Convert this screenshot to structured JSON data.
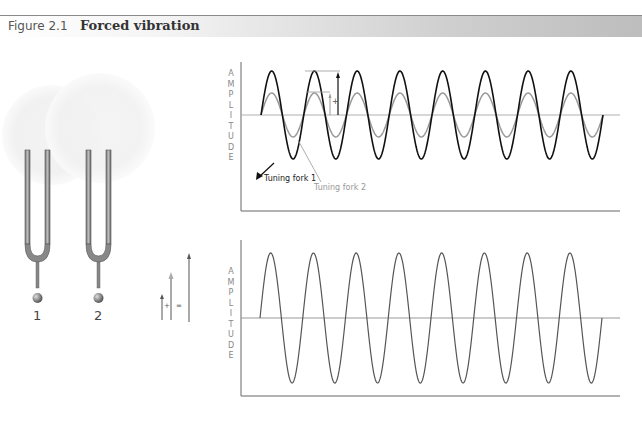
{
  "figure": {
    "number": "Figure 2.1",
    "title": "Forced vibration"
  },
  "forks": [
    {
      "label": "1"
    },
    {
      "label": "2"
    }
  ],
  "vector_sum": {
    "plus": "+",
    "equals": "="
  },
  "top_chart": {
    "ylabel_letters": [
      "A",
      "M",
      "P",
      "L",
      "I",
      "T",
      "U",
      "D",
      "E"
    ],
    "legend": {
      "fork1": "Tuning fork 1",
      "fork2": "Tuning fork 2"
    },
    "plus_symbol": "+"
  },
  "bottom_chart": {
    "ylabel_letters": [
      "A",
      "M",
      "P",
      "L",
      "I",
      "T",
      "U",
      "D",
      "E"
    ]
  },
  "colors": {
    "fork1_wave": "#111111",
    "fork2_wave": "#999999",
    "sum_wave": "#555555",
    "axis": "#666666",
    "baseline": "#a8a8a8"
  },
  "chart_data": [
    {
      "type": "line",
      "title": "Individual vibrations",
      "ylabel": "AMPLITUDE",
      "xlabel": "",
      "series": [
        {
          "name": "Tuning fork 1",
          "amplitude": 1.0,
          "cycles": 8,
          "color": "#111111"
        },
        {
          "name": "Tuning fork 2",
          "amplitude": 0.5,
          "cycles": 8,
          "color": "#999999"
        }
      ],
      "grid": false
    },
    {
      "type": "line",
      "title": "Combined (forced) vibration",
      "ylabel": "AMPLITUDE",
      "xlabel": "",
      "series": [
        {
          "name": "Sum",
          "amplitude": 1.5,
          "cycles": 8,
          "color": "#555555"
        }
      ],
      "grid": false
    }
  ]
}
